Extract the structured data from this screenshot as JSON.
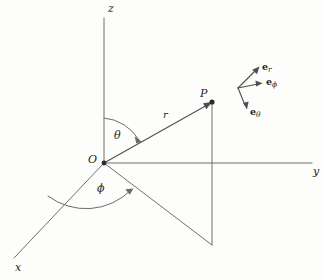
{
  "figure": {
    "type": "spherical-coordinate-diagram",
    "background_color": "#fdfdfb",
    "line_color": "#6f6f6f",
    "text_color": "#1d1d1d"
  },
  "axes": [
    {
      "name": "z",
      "label": "z",
      "direction": "vertical-up"
    },
    {
      "name": "y",
      "label": "y",
      "direction": "horizontal-right"
    },
    {
      "name": "x",
      "label": "x",
      "direction": "diagonal-down-left"
    }
  ],
  "points": [
    {
      "name": "origin",
      "label": "O"
    },
    {
      "name": "point-p",
      "label": "P"
    }
  ],
  "vectors": [
    {
      "name": "radial-vector",
      "label": "r"
    }
  ],
  "angles": [
    {
      "name": "polar-angle",
      "label": "θ",
      "between": "z-axis and r"
    },
    {
      "name": "azimuthal-angle",
      "label": "ϕ",
      "between": "x-axis and projection of r"
    }
  ],
  "unit_vectors": [
    {
      "name": "e-r",
      "base": "e",
      "sub": "r"
    },
    {
      "name": "e-phi",
      "base": "e",
      "sub": "ϕ"
    },
    {
      "name": "e-theta",
      "base": "e",
      "sub": "θ"
    }
  ]
}
